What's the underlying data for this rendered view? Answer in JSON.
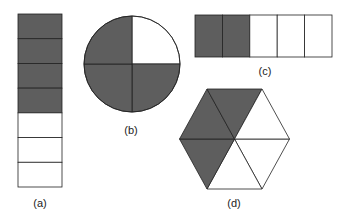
{
  "colors": {
    "shaded": "#5e5e5e",
    "unshaded": "#ffffff",
    "stroke": "#222222",
    "label": "#222222"
  },
  "figures": [
    {
      "id": "a",
      "label": "(a)",
      "shape": "vertical-bar",
      "total_parts": 7,
      "shaded_parts": 4,
      "shaded_description": "top 4 of 7 segments"
    },
    {
      "id": "b",
      "label": "(b)",
      "shape": "circle",
      "total_parts": 4,
      "shaded_parts": 3,
      "shaded_description": "3 of 4 quarters; top-right quarter unshaded"
    },
    {
      "id": "c",
      "label": "(c)",
      "shape": "horizontal-bar",
      "total_parts": 5,
      "shaded_parts": 2,
      "shaded_description": "leftmost 2 of 5 segments"
    },
    {
      "id": "d",
      "label": "(d)",
      "shape": "hexagon",
      "total_parts": 6,
      "shaded_parts": 3,
      "shaded_description": "top, upper-left and lower-left triangles of 6"
    }
  ]
}
